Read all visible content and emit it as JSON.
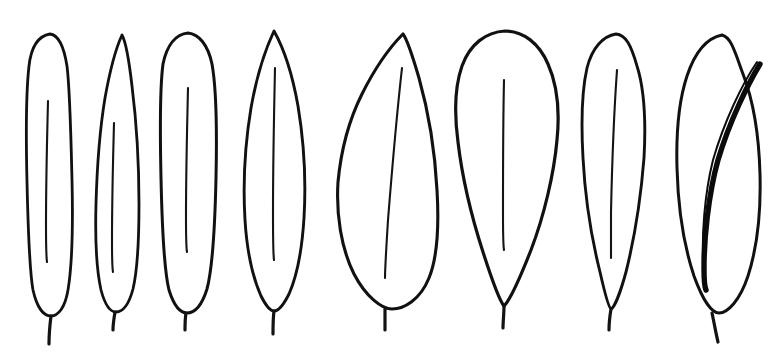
{
  "figure": {
    "background_color": "#ffffff",
    "ink_color": "#111111",
    "width": 777,
    "height": 356,
    "leaf_count": 8,
    "has_labels": false,
    "has_axes": false,
    "has_caption": false
  },
  "leaves": [
    {
      "index": 1,
      "name": "leaf-linear-oblong",
      "shape_term": "linear",
      "apex": "rounded",
      "base": "rounded",
      "bbox": {
        "x": 27,
        "y": 33,
        "width": 46,
        "height": 282
      },
      "widest_at": "middle",
      "midrib": {
        "top_y": 101,
        "bottom_y": 262
      },
      "petiole": {
        "x": 51,
        "top_y": 315,
        "bottom_y": 344
      },
      "stroke_width": 2.8,
      "outline_path": "M 50 34 C 38 36 31 48 29 66 C 26 92 26 140 27 182 C 28 226 29 268 33 290 C 37 308 44 316 51 316 C 58 316 65 308 68 290 C 72 266 73 222 72 180 C 71 138 70 90 67 66 C 64 47 59 35 50 34 Z",
      "midrib_path": "M 48 101 C 47 140 46 190 46 225 C 46 244 46 255 47 262"
    },
    {
      "index": 2,
      "name": "leaf-oblanceolate-acute",
      "shape_term": "oblanceolate",
      "apex": "acute",
      "base": "rounded",
      "bbox": {
        "x": 95,
        "y": 34,
        "width": 46,
        "height": 278
      },
      "widest_at": "below-middle",
      "midrib": {
        "top_y": 123,
        "bottom_y": 272
      },
      "petiole": {
        "x": 113,
        "top_y": 309,
        "bottom_y": 330
      },
      "stroke_width": 2.8,
      "outline_path": "M 122 35 C 116 48 110 70 105 98 C 100 128 97 168 96 204 C 95 240 97 272 101 290 C 105 305 110 312 116 312 C 123 312 129 304 133 289 C 137 272 139 240 139 204 C 139 162 136 118 132 86 C 129 60 126 42 122 35 Z",
      "midrib_path": "M 114 123 C 113 160 112 205 112 240 C 112 258 112 267 113 272"
    },
    {
      "index": 3,
      "name": "leaf-oblong-rounded",
      "shape_term": "oblong",
      "apex": "rounded",
      "base": "rounded",
      "bbox": {
        "x": 160,
        "y": 32,
        "width": 57,
        "height": 282
      },
      "widest_at": "middle",
      "midrib": {
        "top_y": 88,
        "bottom_y": 252
      },
      "petiole": {
        "x": 185,
        "top_y": 312,
        "bottom_y": 330
      },
      "stroke_width": 3.0,
      "outline_path": "M 188 33 C 176 34 167 45 163 64 C 160 86 160 132 161 178 C 162 224 164 270 169 290 C 174 306 180 313 187 313 C 195 313 202 305 207 289 C 212 270 215 224 216 178 C 217 132 216 86 212 64 C 208 45 199 34 188 33 Z",
      "midrib_path": "M 188 88 C 187 130 186 180 186 216 C 186 237 186 247 187 252"
    },
    {
      "index": 4,
      "name": "leaf-lanceolate-acuminate",
      "shape_term": "lanceolate",
      "apex": "acuminate",
      "base": "acute",
      "bbox": {
        "x": 243,
        "y": 30,
        "width": 62,
        "height": 282
      },
      "widest_at": "middle",
      "midrib": {
        "top_y": 68,
        "bottom_y": 260
      },
      "petiole": {
        "x": 273,
        "top_y": 306,
        "bottom_y": 334
      },
      "stroke_width": 2.9,
      "outline_path": "M 274 31 C 266 48 257 74 251 108 C 245 144 243 186 245 220 C 247 252 253 278 261 296 C 267 308 271 311 274 311 C 278 311 283 306 289 294 C 297 276 302 250 304 218 C 306 184 304 142 298 106 C 292 72 283 47 274 31 Z",
      "midrib_path": "M 275 68 C 274 114 273 166 273 212 C 273 240 273 253 274 260"
    },
    {
      "index": 5,
      "name": "leaf-ovate-broad",
      "shape_term": "ovate",
      "apex": "acute",
      "base": "rounded",
      "bbox": {
        "x": 337,
        "y": 33,
        "width": 102,
        "height": 281
      },
      "widest_at": "below-middle",
      "midrib": {
        "top_y": 68,
        "bottom_y": 278
      },
      "petiole": {
        "x": 385,
        "top_y": 308,
        "bottom_y": 330
      },
      "stroke_width": 3.1,
      "outline_path": "M 403 34 C 391 46 375 68 362 94 C 349 120 341 150 338 182 C 336 214 341 248 354 274 C 366 297 382 309 392 309 C 404 309 420 300 429 278 C 438 256 439 224 437 190 C 435 152 428 110 419 78 C 412 54 407 39 403 34 Z",
      "midrib_path": "M 402 68 C 397 112 392 170 388 220 C 386 252 385 270 385 278"
    },
    {
      "index": 6,
      "name": "leaf-obovate",
      "shape_term": "obovate",
      "apex": "rounded",
      "base": "cuneate",
      "bbox": {
        "x": 454,
        "y": 30,
        "width": 104,
        "height": 282
      },
      "widest_at": "above-middle",
      "midrib": {
        "top_y": 80,
        "bottom_y": 250
      },
      "petiole": {
        "x": 503,
        "top_y": 306,
        "bottom_y": 328
      },
      "stroke_width": 3.2,
      "outline_path": "M 505 31 C 486 32 470 44 462 66 C 455 86 454 112 458 142 C 462 176 472 218 483 252 C 492 280 499 300 504 306 C 510 300 520 278 531 250 C 544 216 554 174 557 140 C 560 110 557 84 548 64 C 539 43 523 31 505 31 Z",
      "midrib_path": "M 504 80 C 503 124 503 176 503 212 C 503 236 503 245 504 250"
    },
    {
      "index": 7,
      "name": "leaf-oblanceolate-rounded",
      "shape_term": "oblanceolate",
      "apex": "rounded",
      "base": "attenuate",
      "bbox": {
        "x": 580,
        "y": 33,
        "width": 66,
        "height": 281
      },
      "widest_at": "above-middle",
      "midrib": {
        "top_y": 70,
        "bottom_y": 258
      },
      "petiole": {
        "x": 609,
        "top_y": 308,
        "bottom_y": 330
      },
      "stroke_width": 2.9,
      "outline_path": "M 616 34 C 603 36 592 48 587 68 C 582 90 581 122 583 158 C 585 196 592 240 600 272 C 605 294 609 308 611 309 C 614 308 620 294 626 272 C 634 240 641 196 644 158 C 646 122 644 88 637 66 C 631 45 626 35 616 34 Z",
      "midrib_path": "M 617 70 C 614 112 612 166 611 212 C 611 240 611 252 611 258"
    },
    {
      "index": 8,
      "name": "leaf-elliptic-oblique",
      "shape_term": "elliptic",
      "apex": "obtuse",
      "base": "rounded",
      "bbox": {
        "x": 676,
        "y": 34,
        "width": 86,
        "height": 284
      },
      "widest_at": "middle",
      "midrib_style": "heavy-extended",
      "midrib": {
        "top_y": 62,
        "bottom_y": 288
      },
      "petiole": {
        "x": 713,
        "top_y": 312,
        "bottom_y": 342
      },
      "stroke_width": 3.0,
      "outline_path": "M 722 35 C 707 38 695 52 687 76 C 679 100 676 132 677 168 C 678 206 684 246 694 276 C 703 301 712 313 719 313 C 728 313 740 300 748 276 C 757 248 761 210 760 174 C 759 136 753 100 743 74 C 735 52 731 37 722 35 Z",
      "midrib_path": "M 760 64 C 748 84 730 120 718 160 C 708 196 704 240 704 268 C 704 282 705 288 706 290"
    }
  ],
  "render_notes": {
    "line_style": "hand-drawn ink, variable width",
    "fill_style": "unfilled white interior",
    "arrangement": "single horizontal row, 8 specimens",
    "orientation": "apex up, petiole down"
  }
}
